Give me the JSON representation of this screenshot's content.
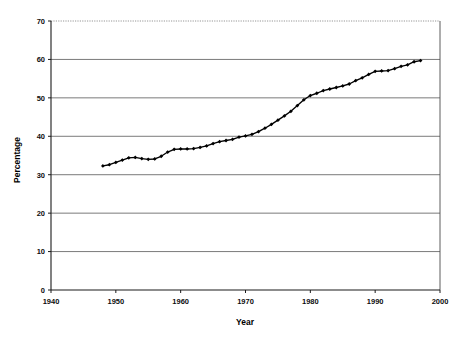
{
  "chart_data": {
    "type": "line",
    "title": "",
    "xlabel": "Year",
    "ylabel": "Percentage",
    "xlim": [
      1940,
      2000
    ],
    "ylim": [
      0,
      70
    ],
    "xticks": [
      1940,
      1950,
      1960,
      1970,
      1980,
      1990,
      2000
    ],
    "yticks": [
      0,
      10,
      20,
      30,
      40,
      50,
      60,
      70
    ],
    "grid": "horizontal",
    "legend": "none",
    "marker": "diamond",
    "series": [
      {
        "name": "Percentage",
        "x": [
          1948,
          1949,
          1950,
          1951,
          1952,
          1953,
          1954,
          1955,
          1956,
          1957,
          1958,
          1959,
          1960,
          1961,
          1962,
          1963,
          1964,
          1965,
          1966,
          1967,
          1968,
          1969,
          1970,
          1971,
          1972,
          1973,
          1974,
          1975,
          1976,
          1977,
          1978,
          1979,
          1980,
          1981,
          1982,
          1983,
          1984,
          1985,
          1986,
          1987,
          1988,
          1989,
          1990,
          1991,
          1992,
          1993,
          1994,
          1995,
          1996,
          1997
        ],
        "values": [
          32.3,
          32.6,
          33.2,
          33.8,
          34.4,
          34.5,
          34.2,
          34.0,
          34.1,
          34.8,
          35.9,
          36.6,
          36.7,
          36.7,
          36.8,
          37.1,
          37.5,
          38.1,
          38.6,
          38.9,
          39.2,
          39.8,
          40.1,
          40.5,
          41.2,
          42.1,
          43.1,
          44.2,
          45.3,
          46.5,
          48.0,
          49.5,
          50.6,
          51.2,
          51.9,
          52.3,
          52.7,
          53.1,
          53.6,
          54.5,
          55.2,
          56.1,
          56.9,
          57.0,
          57.1,
          57.6,
          58.2,
          58.6,
          59.4,
          59.7
        ]
      }
    ]
  },
  "axis": {
    "x_title": "Year",
    "y_title": "Percentage",
    "x_tick_labels": [
      "1940",
      "1950",
      "1960",
      "1970",
      "1980",
      "1990",
      "2000"
    ],
    "y_tick_labels": [
      "0",
      "10",
      "20",
      "30",
      "40",
      "50",
      "60",
      "70"
    ]
  }
}
